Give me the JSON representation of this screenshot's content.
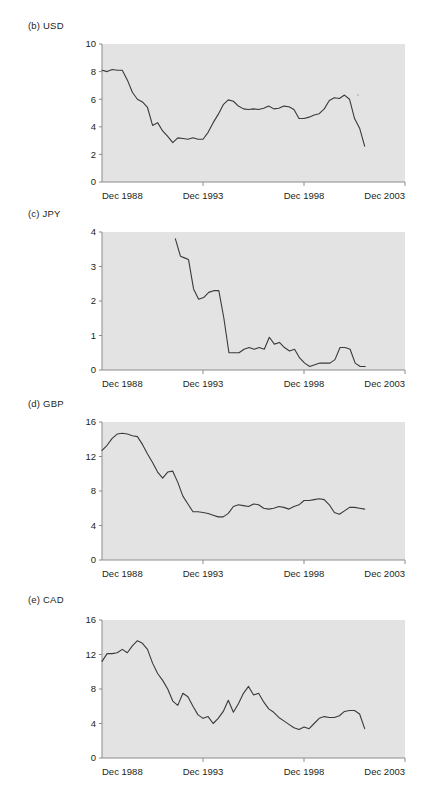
{
  "figure": {
    "background": "#ffffff",
    "plot_background": "#e3e3e3",
    "line_color": "#3a3a3a",
    "axis_color": "#8c8c8c"
  },
  "panels": [
    {
      "key": "usd",
      "label": "(b) USD",
      "top": 20,
      "height": 185,
      "plot": {
        "x": 102,
        "y": 44,
        "w": 303,
        "h": 138
      },
      "chart_data": {
        "type": "line",
        "title": "(b) USD",
        "xlabel": "",
        "ylabel": "",
        "xlim": [
          1988.917,
          2003.917
        ],
        "ylim": [
          0,
          10
        ],
        "grid": false,
        "legend": null,
        "yticks": [
          0,
          2,
          4,
          6,
          8,
          10
        ],
        "ytick_labels": [
          "0",
          "2",
          "4",
          "6",
          "8",
          "10"
        ],
        "xticks": [
          1988.917,
          1993.917,
          1998.917,
          2003.917
        ],
        "xtick_labels": [
          "Dec 1988",
          "Dec 1993",
          "Dec 1998",
          "Dec 2003"
        ],
        "series": [
          {
            "name": "USD",
            "x": [
              1988.92,
              1989.17,
              1989.42,
              1989.67,
              1989.92,
              1990.17,
              1990.42,
              1990.67,
              1990.92,
              1991.17,
              1991.42,
              1991.67,
              1991.92,
              1992.17,
              1992.42,
              1992.67,
              1992.92,
              1993.17,
              1993.42,
              1993.67,
              1993.92,
              1994.17,
              1994.42,
              1994.67,
              1994.92,
              1995.17,
              1995.42,
              1995.67,
              1995.92,
              1996.17,
              1996.42,
              1996.67,
              1996.92,
              1997.17,
              1997.42,
              1997.67,
              1997.92,
              1998.17,
              1998.42,
              1998.67,
              1998.92,
              1999.17,
              1999.42,
              1999.67,
              1999.92,
              2000.17,
              2000.42,
              2000.67,
              2000.92,
              2001.17,
              2001.42,
              2001.67,
              2001.92
            ],
            "y": [
              8.1,
              8.0,
              8.15,
              8.1,
              8.1,
              7.4,
              6.5,
              6.0,
              5.8,
              5.4,
              4.1,
              4.3,
              3.7,
              3.3,
              2.85,
              3.2,
              3.15,
              3.1,
              3.2,
              3.1,
              3.1,
              3.6,
              4.3,
              4.9,
              5.6,
              5.95,
              5.85,
              5.5,
              5.3,
              5.25,
              5.3,
              5.25,
              5.35,
              5.5,
              5.3,
              5.35,
              5.5,
              5.45,
              5.25,
              4.6,
              4.6,
              4.7,
              4.85,
              4.95,
              5.3,
              5.9,
              6.1,
              6.05,
              6.3,
              6.0,
              4.6,
              3.9,
              2.6
            ]
          }
        ]
      }
    },
    {
      "key": "jpy",
      "label": "(c) JPY",
      "top": 208,
      "height": 185,
      "plot": {
        "x": 102,
        "y": 232,
        "w": 303,
        "h": 138
      },
      "chart_data": {
        "type": "line",
        "title": "(c) JPY",
        "xlabel": "",
        "ylabel": "",
        "xlim": [
          1988.917,
          2003.917
        ],
        "ylim": [
          0,
          4
        ],
        "grid": false,
        "legend": null,
        "yticks": [
          0,
          1,
          2,
          3,
          4
        ],
        "ytick_labels": [
          "0",
          "1",
          "2",
          "3",
          "4"
        ],
        "xticks": [
          1988.917,
          1993.917,
          1998.917,
          2003.917
        ],
        "xtick_labels": [
          "Dec 1988",
          "Dec 1993",
          "Dec 1998",
          "Dec 2003"
        ],
        "series": [
          {
            "name": "JPY",
            "x": [
              1992.55,
              1992.8,
              1993.0,
              1993.2,
              1993.45,
              1993.7,
              1993.95,
              1994.2,
              1994.45,
              1994.7,
              1994.95,
              1995.2,
              1995.45,
              1995.7,
              1995.95,
              1996.2,
              1996.45,
              1996.7,
              1996.95,
              1997.2,
              1997.45,
              1997.7,
              1997.95,
              1998.2,
              1998.45,
              1998.7,
              1998.95,
              1999.2,
              1999.45,
              1999.7,
              1999.95,
              2000.2,
              2000.45,
              2000.7,
              2000.95,
              2001.2,
              2001.45,
              2001.7,
              2001.95
            ],
            "y": [
              3.8,
              3.3,
              3.25,
              3.2,
              2.35,
              2.05,
              2.1,
              2.25,
              2.3,
              2.3,
              1.5,
              0.5,
              0.5,
              0.5,
              0.6,
              0.65,
              0.6,
              0.65,
              0.6,
              0.95,
              0.75,
              0.8,
              0.65,
              0.55,
              0.6,
              0.35,
              0.2,
              0.1,
              0.15,
              0.2,
              0.2,
              0.2,
              0.3,
              0.65,
              0.65,
              0.6,
              0.2,
              0.1,
              0.1
            ]
          }
        ]
      }
    },
    {
      "key": "gbp",
      "label": "(d) GBP",
      "top": 398,
      "height": 185,
      "plot": {
        "x": 102,
        "y": 422,
        "w": 303,
        "h": 138
      },
      "chart_data": {
        "type": "line",
        "title": "(d) GBP",
        "xlabel": "",
        "ylabel": "",
        "xlim": [
          1988.917,
          2003.917
        ],
        "ylim": [
          0,
          16
        ],
        "grid": false,
        "legend": null,
        "yticks": [
          0,
          4,
          8,
          12,
          16
        ],
        "ytick_labels": [
          "0",
          "4",
          "8",
          "12",
          "16"
        ],
        "xticks": [
          1988.917,
          1993.917,
          1998.917,
          2003.917
        ],
        "xtick_labels": [
          "Dec 1988",
          "Dec 1993",
          "Dec 1998",
          "Dec 2003"
        ],
        "series": [
          {
            "name": "GBP",
            "x": [
              1988.92,
              1989.17,
              1989.42,
              1989.67,
              1989.92,
              1990.17,
              1990.42,
              1990.67,
              1990.92,
              1991.17,
              1991.42,
              1991.67,
              1991.92,
              1992.17,
              1992.42,
              1992.67,
              1992.92,
              1993.17,
              1993.42,
              1993.67,
              1993.92,
              1994.17,
              1994.42,
              1994.67,
              1994.92,
              1995.17,
              1995.42,
              1995.67,
              1995.92,
              1996.17,
              1996.42,
              1996.67,
              1996.92,
              1997.17,
              1997.42,
              1997.67,
              1997.92,
              1998.17,
              1998.42,
              1998.67,
              1998.92,
              1999.17,
              1999.42,
              1999.67,
              1999.92,
              2000.17,
              2000.42,
              2000.67,
              2000.92,
              2001.17,
              2001.42,
              2001.67,
              2001.92
            ],
            "y": [
              12.7,
              13.3,
              14.1,
              14.6,
              14.7,
              14.6,
              14.4,
              14.3,
              13.4,
              12.3,
              11.3,
              10.2,
              9.5,
              10.2,
              10.3,
              9.0,
              7.4,
              6.5,
              5.6,
              5.6,
              5.5,
              5.4,
              5.2,
              5.0,
              5.0,
              5.4,
              6.2,
              6.4,
              6.3,
              6.2,
              6.5,
              6.4,
              6.0,
              5.9,
              6.0,
              6.2,
              6.1,
              5.9,
              6.2,
              6.4,
              6.9,
              6.9,
              7.0,
              7.1,
              7.0,
              6.4,
              5.5,
              5.3,
              5.7,
              6.1,
              6.1,
              6.0,
              5.9,
              5.8,
              5.4,
              4.9
            ]
          }
        ]
      }
    },
    {
      "key": "cad",
      "label": "(e) CAD",
      "top": 594,
      "height": 190,
      "plot": {
        "x": 102,
        "y": 620,
        "w": 303,
        "h": 138
      },
      "chart_data": {
        "type": "line",
        "title": "(e) CAD",
        "xlabel": "",
        "ylabel": "",
        "xlim": [
          1988.917,
          2003.917
        ],
        "ylim": [
          0,
          16
        ],
        "grid": false,
        "legend": null,
        "yticks": [
          0,
          4,
          8,
          12,
          16
        ],
        "ytick_labels": [
          "0",
          "4",
          "8",
          "12",
          "16"
        ],
        "xticks": [
          1988.917,
          1993.917,
          1998.917,
          2003.917
        ],
        "xtick_labels": [
          "Dec 1988",
          "Dec 1993",
          "Dec 1998",
          "Dec 2003"
        ],
        "series": [
          {
            "name": "CAD",
            "x": [
              1988.92,
              1989.17,
              1989.42,
              1989.67,
              1989.92,
              1990.17,
              1990.42,
              1990.67,
              1990.92,
              1991.17,
              1991.42,
              1991.67,
              1991.92,
              1992.17,
              1992.42,
              1992.67,
              1992.92,
              1993.17,
              1993.42,
              1993.67,
              1993.92,
              1994.17,
              1994.42,
              1994.67,
              1994.92,
              1995.17,
              1995.42,
              1995.67,
              1995.92,
              1996.17,
              1996.42,
              1996.67,
              1996.92,
              1997.17,
              1997.42,
              1997.67,
              1997.92,
              1998.17,
              1998.42,
              1998.67,
              1998.92,
              1999.17,
              1999.42,
              1999.67,
              1999.92,
              2000.17,
              2000.42,
              2000.67,
              2000.92,
              2001.17,
              2001.42,
              2001.67,
              2001.92
            ],
            "y": [
              11.2,
              12.1,
              12.1,
              12.2,
              12.6,
              12.2,
              13.0,
              13.6,
              13.3,
              12.6,
              11.0,
              9.8,
              9.0,
              8.0,
              6.6,
              6.1,
              7.5,
              7.1,
              6.0,
              5.0,
              4.6,
              4.8,
              4.0,
              4.6,
              5.4,
              6.7,
              5.3,
              6.3,
              7.5,
              8.3,
              7.3,
              7.5,
              6.5,
              5.7,
              5.3,
              4.7,
              4.3,
              3.9,
              3.5,
              3.3,
              3.6,
              3.4,
              4.0,
              4.6,
              4.8,
              4.7,
              4.7,
              4.9,
              5.4,
              5.5,
              5.5,
              5.1,
              3.4
            ]
          }
        ]
      }
    }
  ]
}
